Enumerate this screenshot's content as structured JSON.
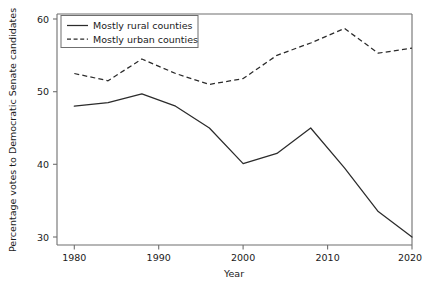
{
  "chart_data": {
    "type": "line",
    "title": "",
    "subtitle": "",
    "xlabel": "Year",
    "ylabel": "Percentage votes to Democratic Senate candidates",
    "x": [
      1980,
      1984,
      1988,
      1992,
      1996,
      2000,
      2004,
      2008,
      2012,
      2016,
      2020
    ],
    "xlim": [
      1978,
      2021
    ],
    "ylim": [
      29,
      61
    ],
    "xticks": [
      1980,
      1990,
      2000,
      2010,
      2020
    ],
    "xtick_labels": [
      "1980",
      "1990",
      "2000",
      "2010",
      "2020"
    ],
    "yticks": [
      30,
      40,
      50,
      60
    ],
    "ytick_labels": [
      "30",
      "40",
      "50",
      "60"
    ],
    "grid": false,
    "legend_position": "top-left",
    "series": [
      {
        "name": "Mostly rural counties",
        "style": "solid",
        "color": "#2b2b2b",
        "values": [
          48.0,
          48.5,
          49.7,
          48.0,
          45.0,
          40.1,
          41.5,
          45.0,
          39.5,
          33.5,
          30.0
        ]
      },
      {
        "name": "Mostly urban counties",
        "style": "dashed",
        "color": "#2b2b2b",
        "values": [
          52.5,
          51.5,
          54.5,
          52.5,
          51.0,
          51.8,
          55.0,
          56.7,
          58.7,
          55.3,
          56.0
        ]
      }
    ]
  },
  "legend": {
    "entries": [
      {
        "label": "Mostly rural counties",
        "style": "solid"
      },
      {
        "label": "Mostly urban counties",
        "style": "dashed"
      }
    ]
  },
  "axes": {
    "x_axis_title": "Year",
    "y_axis_title": "Percentage votes to Democratic Senate candidates"
  }
}
